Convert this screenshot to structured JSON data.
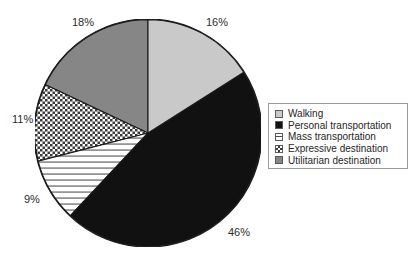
{
  "chart_data": {
    "type": "pie",
    "title": "",
    "subtitle": "",
    "xlabel": "",
    "ylabel": "",
    "legend_position": "right",
    "grid": false,
    "start_angle_deg": 90,
    "direction": "clockwise",
    "categories": [
      "Walking",
      "Personal transportation",
      "Mass transportation",
      "Expressive destination",
      "Utilitarian destination"
    ],
    "values": [
      16,
      46,
      9,
      11,
      18
    ],
    "data_labels": [
      "16%",
      "46%",
      "9%",
      "11%",
      "18%"
    ],
    "slices": [
      {
        "label": "Walking",
        "value": 16,
        "data_label": "16%",
        "fill": "#c9c9c9",
        "pattern": "solid-light-gray",
        "start_deg": 0,
        "end_deg": 57.6
      },
      {
        "label": "Personal transportation",
        "value": 46,
        "data_label": "46%",
        "fill": "#111111",
        "pattern": "solid-black",
        "start_deg": 57.6,
        "end_deg": 223.2
      },
      {
        "label": "Mass transportation",
        "value": 9,
        "data_label": "9%",
        "fill": "#ffffff",
        "pattern": "horizontal-lines",
        "start_deg": 223.2,
        "end_deg": 255.6
      },
      {
        "label": "Expressive destination",
        "value": 11,
        "data_label": "11%",
        "fill": "#ffffff",
        "pattern": "checker-dots",
        "start_deg": 255.6,
        "end_deg": 295.2
      },
      {
        "label": "Utilitarian destination",
        "value": 18,
        "data_label": "18%",
        "fill": "#868686",
        "pattern": "solid-medium-gray",
        "start_deg": 295.2,
        "end_deg": 360
      }
    ]
  },
  "legend": {
    "items": [
      {
        "label": "Walking",
        "swatch": "light-gray-solid-swatch"
      },
      {
        "label": "Personal transportation",
        "swatch": "black-solid-swatch"
      },
      {
        "label": "Mass transportation",
        "swatch": "horizontal-lines-swatch"
      },
      {
        "label": "Expressive destination",
        "swatch": "checker-dots-swatch"
      },
      {
        "label": "Utilitarian destination",
        "swatch": "medium-gray-solid-swatch"
      }
    ]
  },
  "colors": {
    "walking": "#c9c9c9",
    "personal_transportation": "#111111",
    "mass_transportation": "#ffffff",
    "expressive_destination": "#ffffff",
    "utilitarian_destination": "#868686",
    "outline": "#1a1a1a",
    "legend_border": "#9a9a9a",
    "label_text": "#2b2b2b",
    "background": "#ffffff"
  }
}
